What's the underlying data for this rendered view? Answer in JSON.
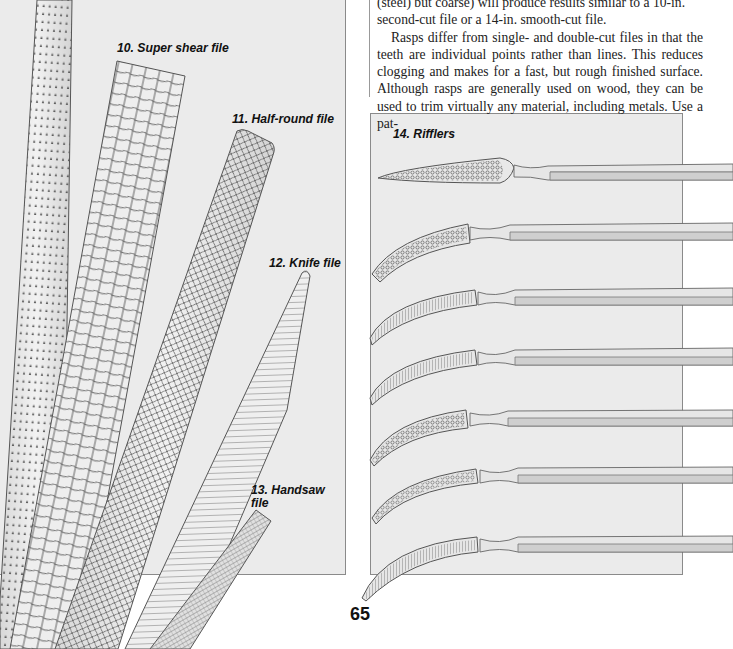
{
  "page": {
    "number": "65",
    "body_text": {
      "paragraph_1_tail": "(steel) but coarse) will produce results similar to a 10-in. second-cut file or a 14-in. smooth-cut file.",
      "line_1": "(steel) but coarse) will produce results similar to a 10-in.",
      "line_2": "second-cut file or a 14-in. smooth-cut file.",
      "paragraph_2": "Rasps differ from single- and double-cut files in that the teeth are individual points rather than lines. This reduces clogging and makes for a fast, but rough finished surface. Although rasps are generally used on wood, they can be used to trim virtually any material, including metals. Use a pat-"
    }
  },
  "figures": {
    "left_panel": {
      "captions": [
        {
          "id": "10",
          "label": "10. Super shear file"
        },
        {
          "id": "11",
          "label": "11. Half-round file"
        },
        {
          "id": "12",
          "label": "12. Knife file"
        },
        {
          "id": "13",
          "label": "13. Handsaw file"
        }
      ],
      "caption_13_line1": "13. Handsaw",
      "caption_13_line2": "file",
      "items": [
        "rasp (point teeth)",
        "super shear file",
        "half-round file",
        "knife file",
        "handsaw file"
      ]
    },
    "right_panel": {
      "caption": "14. Rifflers",
      "riffler_count": 7
    }
  },
  "colors": {
    "panel_bg": "#ebebeb",
    "panel_border": "#8a8a8a",
    "line_art": "#555555",
    "handle_light": "#e4e4e4",
    "handle_dark": "#c8c8c8"
  }
}
